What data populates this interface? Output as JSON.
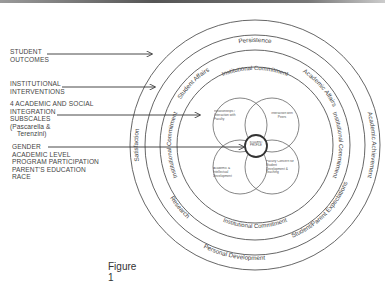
{
  "inputs": [
    {
      "id": "outcomes",
      "lines": [
        "STUDENT",
        "OUTCOMES"
      ]
    },
    {
      "id": "interventions",
      "lines": [
        "INSTITUTIONAL",
        "INTERVENTIONS"
      ]
    },
    {
      "id": "subscales",
      "lines": [
        "4 ACADEMIC AND SOCIAL",
        "INTEGRATION",
        "SUBSCALES",
        "(Pascarella &",
        "Terenzini)"
      ]
    },
    {
      "id": "demographics",
      "lines": [
        "GENDER",
        "ACADEMIC LEVEL",
        "PROGRAM PARTICIPATION",
        "PARENT'S EDUCATION",
        "RACE"
      ]
    }
  ],
  "rings": {
    "outcomes": [
      "Persistence",
      "Academic Achievement",
      "Personal Development",
      "Satisfaction"
    ],
    "interventions": [
      "Student Affairs",
      "Academic Affairs",
      "Student/Parent Expectations",
      "Research"
    ],
    "commitment": [
      "Institutional Commitment",
      "Institutional Commitment",
      "Institutional Commitment",
      "Institutional Commitment"
    ]
  },
  "subscales": [
    "Relationships / Interaction with Faculty",
    "Interaction with Peers",
    "Academic & Intellectual Development",
    "Faculty Concern for Student Development & Teaching"
  ],
  "center": "STUDENT PROFILE",
  "caption": "Figure 1"
}
